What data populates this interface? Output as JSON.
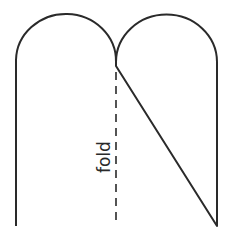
{
  "diagram": {
    "type": "pattern-template",
    "shape": "double-arch outline (two rounded lobes over a rectangle)",
    "fold_label": "fold",
    "fold_line_style": "dashed",
    "colors": {
      "stroke": "#2a2a2a",
      "background": "#ffffff"
    }
  }
}
